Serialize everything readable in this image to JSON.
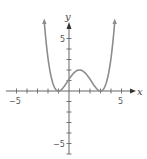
{
  "chart_data": {
    "type": "line",
    "title": "",
    "xlabel": "x",
    "ylabel": "y",
    "xlim": [
      -6,
      6
    ],
    "ylim": [
      -6.5,
      7
    ],
    "x_tick_labels": [
      "-5",
      "5"
    ],
    "y_tick_labels": [
      "5",
      "-5"
    ],
    "x_ticks": [
      -5,
      -4,
      -3,
      -2,
      -1,
      1,
      2,
      3,
      4,
      5
    ],
    "y_ticks": [
      -6,
      -5,
      -4,
      -3,
      -2,
      -1,
      1,
      2,
      3,
      4,
      5
    ],
    "grid": false,
    "legend": null,
    "series": [
      {
        "name": "f(x)",
        "description": "Quartic curve touching x-axis at x=-1 and x=3 (double roots), local max of about 2 at x=1, rising toward +infinity on both ends (arrowheads)",
        "x": [
          -2.35,
          -2,
          -1.5,
          -1,
          -0.5,
          0,
          0.5,
          1,
          1.5,
          2,
          2.5,
          3,
          3.5,
          4,
          4.35
        ],
        "y": [
          6.6,
          3.13,
          0.95,
          0,
          0.38,
          1.13,
          1.76,
          2,
          1.76,
          1.13,
          0.38,
          0,
          0.95,
          3.13,
          6.6
        ]
      }
    ],
    "colors": {
      "curve": "#8c8c8c",
      "axes": "#666666"
    }
  },
  "labels": {
    "x_axis": "x",
    "y_axis": "y",
    "x_neg": "−5",
    "x_pos": "5",
    "y_pos": "5",
    "y_neg": "−5"
  }
}
